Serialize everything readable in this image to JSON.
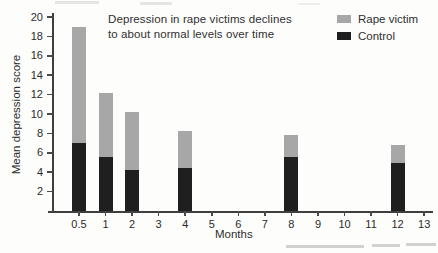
{
  "figure": {
    "annotation": {
      "line1": "Depression in rape victims declines",
      "line2": "to about normal levels over time"
    },
    "axes": {
      "ylabel": "Mean depression score",
      "xlabel": "Months"
    },
    "legend": {
      "items": [
        {
          "label": "Rape victim",
          "color": "#a7a7a7"
        },
        {
          "label": "Control",
          "color": "#1f1f1f"
        }
      ]
    }
  },
  "chart_data": {
    "type": "bar",
    "subtype": "overlaid-bars",
    "title": "Depression in rape victims declines to about normal levels over time",
    "xlabel": "Months",
    "ylabel": "Mean depression score",
    "ylim": [
      0,
      20
    ],
    "yticks": [
      2,
      4,
      6,
      8,
      10,
      12,
      14,
      16,
      18,
      20
    ],
    "categories": [
      "0.5",
      "1",
      "2",
      "3",
      "4",
      "5",
      "6",
      "7",
      "8",
      "9",
      "10",
      "11",
      "12",
      "13"
    ],
    "grid": false,
    "legend_position": "top-right",
    "series": [
      {
        "name": "Rape victim",
        "color": "#a7a7a7",
        "values": [
          19.0,
          12.2,
          10.2,
          null,
          8.2,
          null,
          null,
          null,
          7.8,
          null,
          null,
          null,
          6.8,
          null
        ]
      },
      {
        "name": "Control",
        "color": "#1f1f1f",
        "values": [
          7.0,
          5.6,
          4.2,
          null,
          4.4,
          null,
          null,
          null,
          5.6,
          null,
          null,
          null,
          4.9,
          null
        ]
      }
    ]
  }
}
